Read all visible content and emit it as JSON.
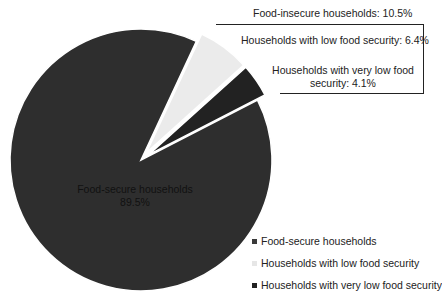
{
  "chart_data": {
    "type": "pie",
    "title": "",
    "categories": [
      "Food-secure households",
      "Households with low food security",
      "Households with very low food security"
    ],
    "values": [
      89.5,
      6.4,
      4.1
    ],
    "unit": "%",
    "colors": [
      "#2e2e2e",
      "#ebebeb",
      "#222222"
    ],
    "exploded": [
      false,
      true,
      true
    ],
    "slice_labels": {
      "food_secure_line1": "Food-secure households",
      "food_secure_line2": "89.5%",
      "food_insecure_total": "Food-insecure households: 10.5%",
      "low": "Households with low food security: 6.4%",
      "very_low_line1": "Households with very low food",
      "very_low_line2": "security: 4.1%"
    },
    "legend": {
      "position": "bottom-right",
      "entries": [
        "Food-secure households",
        "Households with low food security",
        "Households with very low food security"
      ]
    },
    "geometry": {
      "cx": 141,
      "cy": 160,
      "r": 131,
      "start_angle_deg": 25,
      "explode_offset": 9
    }
  }
}
